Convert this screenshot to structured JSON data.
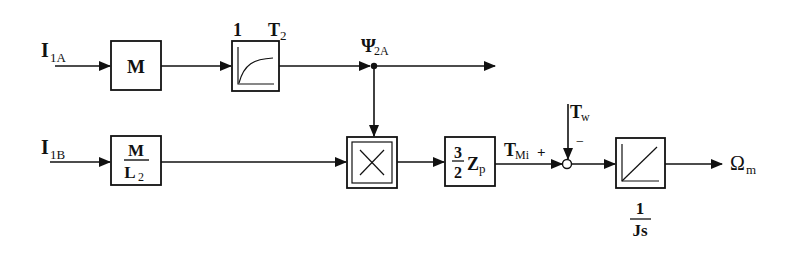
{
  "diagram": {
    "type": "block-diagram",
    "title": "",
    "inputs": {
      "i1a": {
        "main": "I",
        "sub": "1A"
      },
      "i1b": {
        "main": "I",
        "sub": "1B"
      },
      "tw": {
        "main": "T",
        "sub": "w"
      }
    },
    "blocks": {
      "gain_m": {
        "label": "M"
      },
      "pt1": {
        "gain_label": "1",
        "time_const_main": "T",
        "time_const_sub": "2",
        "icon": "first-order-lag-icon"
      },
      "gain_m_over_l2": {
        "numerator": "M",
        "denominator_main": "L",
        "denominator_sub": "2"
      },
      "multiplier": {
        "icon": "multiply-icon"
      },
      "torque_gain": {
        "num": "3",
        "den": "2",
        "main": "Z",
        "sub": "p"
      },
      "integrator": {
        "icon": "integrator-icon",
        "num": "1",
        "den": "Js"
      }
    },
    "signals": {
      "psi2a": {
        "main": "Ψ",
        "sub": "2A"
      },
      "tmi": {
        "main": "T",
        "sub": "Mi",
        "sign": "+"
      },
      "tw_sign": "−",
      "omega": {
        "main": "Ω",
        "sub": "m"
      }
    }
  }
}
